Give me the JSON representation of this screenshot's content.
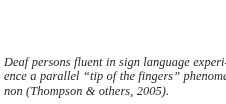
{
  "page": {
    "background_color": "#ffffff",
    "text_color": "#2a2724",
    "kind": "scanned-textbook-excerpt"
  },
  "excerpt": {
    "full_text": "Deaf persons fluent in sign language experience a parallel “tip of the fingers” phenomenon (Thompson & others, 2005).",
    "lines": [
      "Deaf persons fluent in sign language experi-",
      "ence a parallel “tip of the fingers” phenome-",
      "non (Thompson & others, 2005)."
    ],
    "citation": "(Thompson & others, 2005)",
    "citation_author": "Thompson & others",
    "citation_year": "2005",
    "quoted_phrase": "tip of the fingers"
  }
}
